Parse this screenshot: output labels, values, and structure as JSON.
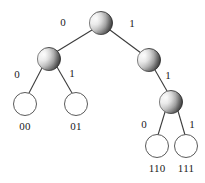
{
  "diagram": {
    "type": "binary-tree",
    "colors": {
      "node_edge": "#4a4a4a",
      "node_light": "#f2f2f2",
      "node_mid": "#b4b4b4",
      "node_dark": "#4f4f4f",
      "leaf_fill": "#ffffff",
      "leaf_stroke": "#5a5a5a",
      "edge_line": "#3c3c3c",
      "label_text": "#1a1a1a",
      "background": "#ffffff"
    },
    "nodes": [
      {
        "id": "root",
        "kind": "internal",
        "cx": 101,
        "cy": 23,
        "r": 11.5,
        "label": ""
      },
      {
        "id": "n0",
        "kind": "internal",
        "cx": 49,
        "cy": 59,
        "r": 11.5,
        "label": ""
      },
      {
        "id": "n1",
        "kind": "internal",
        "cx": 149,
        "cy": 60,
        "r": 11.5,
        "label": ""
      },
      {
        "id": "n11",
        "kind": "internal",
        "cx": 171,
        "cy": 102,
        "r": 11.5,
        "label": ""
      },
      {
        "id": "leaf00",
        "kind": "leaf",
        "cx": 25,
        "cy": 104,
        "r": 11.5,
        "label": "00"
      },
      {
        "id": "leaf01",
        "kind": "leaf",
        "cx": 76,
        "cy": 104,
        "r": 11.5,
        "label": "01"
      },
      {
        "id": "leaf110",
        "kind": "leaf",
        "cx": 157,
        "cy": 146,
        "r": 11.5,
        "label": "110"
      },
      {
        "id": "leaf111",
        "kind": "leaf",
        "cx": 186,
        "cy": 146,
        "r": 11.5,
        "label": "111"
      }
    ],
    "edges": [
      {
        "id": "e-root-n0",
        "from": "root",
        "to": "n0",
        "bit": "0",
        "label_x": 63,
        "label_y": 26
      },
      {
        "id": "e-root-n1",
        "from": "root",
        "to": "n1",
        "bit": "1",
        "label_x": 132,
        "label_y": 27
      },
      {
        "id": "e-n0-leaf00",
        "from": "n0",
        "to": "leaf00",
        "bit": "0",
        "label_x": 17,
        "label_y": 78
      },
      {
        "id": "e-n0-leaf01",
        "from": "n0",
        "to": "leaf01",
        "bit": "1",
        "label_x": 72,
        "label_y": 77
      },
      {
        "id": "e-n1-n11",
        "from": "n1",
        "to": "n11",
        "bit": "1",
        "label_x": 168,
        "label_y": 79
      },
      {
        "id": "e-n11-leaf110",
        "from": "n11",
        "to": "leaf110",
        "bit": "0",
        "label_x": 144,
        "label_y": 128
      },
      {
        "id": "e-n11-leaf111",
        "from": "n11",
        "to": "leaf111",
        "bit": "1",
        "label_x": 192,
        "label_y": 128
      }
    ],
    "codewords": [
      "00",
      "01",
      "110",
      "111"
    ]
  }
}
